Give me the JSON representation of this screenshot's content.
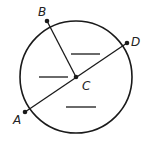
{
  "diagram": {
    "type": "circle-geometry",
    "circle": {
      "cx": 76,
      "cy": 77,
      "r": 56
    },
    "points": [
      {
        "id": "A",
        "label": "A",
        "x": 25,
        "y": 112,
        "label_x": 13,
        "label_y": 124
      },
      {
        "id": "B",
        "label": "B",
        "x": 47,
        "y": 21,
        "label_x": 38,
        "label_y": 16
      },
      {
        "id": "C",
        "label": "C",
        "x": 76,
        "y": 77,
        "label_x": 82,
        "label_y": 90
      },
      {
        "id": "D",
        "label": "D",
        "x": 127,
        "y": 43,
        "label_x": 131,
        "label_y": 46
      }
    ],
    "segments": [
      {
        "from": "A",
        "to": "D",
        "role": "diameter"
      },
      {
        "from": "B",
        "to": "C",
        "role": "radius"
      }
    ],
    "answer_blanks": [
      {
        "x1": 71,
        "y1": 54,
        "x2": 100,
        "y2": 54
      },
      {
        "x1": 39,
        "y1": 77,
        "x2": 68,
        "y2": 77
      },
      {
        "x1": 66,
        "y1": 107,
        "x2": 96,
        "y2": 107
      }
    ],
    "colors": {
      "stroke": "#1a1a1a",
      "background": "#ffffff"
    }
  }
}
